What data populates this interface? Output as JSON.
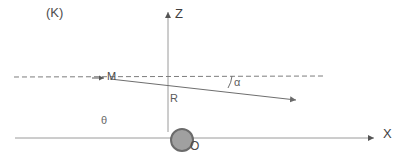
{
  "figure": {
    "panel_label": "(K)",
    "background_color": "#ffffff",
    "width": 408,
    "height": 165,
    "axes": {
      "vertical_axis_label": "Z",
      "horizontal_axis_label": "X",
      "origin_label": "O",
      "axis_color": "#9a9a9a",
      "arrow_color": "#555555"
    },
    "labels": {
      "point_m": "M",
      "radius": "R",
      "angle_alpha": "α",
      "angle_theta": "θ"
    },
    "sphere": {
      "name": "origin-sphere",
      "fill_color": "#a0a0a0",
      "stroke_color": "#6b6b6b",
      "center_x": 182,
      "center_y": 140,
      "radius": 11
    },
    "dashed_reference_line": {
      "color": "#777777",
      "style": "dashed",
      "x_start": 14,
      "y_start": 77,
      "x_end": 325,
      "y_end": 76
    },
    "incoming_ray": {
      "color": "#666666",
      "arrow_at_x": 106,
      "arrow_at_y": 78
    },
    "deflected_ray": {
      "color": "#6e6e6e",
      "x_start": 110,
      "y_start": 79,
      "x_end": 303,
      "y_end": 101
    }
  }
}
